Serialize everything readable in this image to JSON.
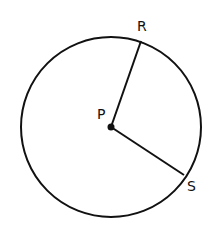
{
  "diagram": {
    "type": "geometry-circle",
    "canvas": {
      "width": 213,
      "height": 234,
      "background": "#ffffff"
    },
    "stroke_color": "#111111",
    "circle": {
      "cx": 111,
      "cy": 127,
      "r": 90
    },
    "center": {
      "label": "P",
      "x": 111,
      "y": 127,
      "label_x": 97,
      "label_y": 119
    },
    "points": [
      {
        "label": "R",
        "x": 141,
        "y": 41,
        "label_x": 137,
        "label_y": 31
      },
      {
        "label": "S",
        "x": 184,
        "y": 175,
        "label_x": 187,
        "label_y": 191
      }
    ],
    "segments": [
      {
        "name": "radius-PR",
        "from": "P",
        "to": "R"
      },
      {
        "name": "radius-PS",
        "from": "P",
        "to": "S"
      }
    ]
  }
}
